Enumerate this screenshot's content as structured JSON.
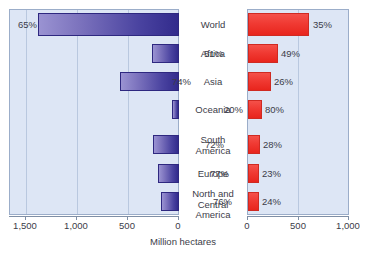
{
  "chart_data": {
    "type": "bar",
    "title": "",
    "subtitle": "",
    "xlabel": "Million hectares",
    "ylabel": "",
    "orientation": "horizontal",
    "layout": "back-to-back bidirectional panels",
    "grid": true,
    "legend": "none",
    "categories": [
      "World",
      "Africa",
      "Asia",
      "Oceania",
      "South America",
      "Europe",
      "North and Central America"
    ],
    "left_axis": {
      "title": "Million hectares",
      "direction": "right-to-left",
      "range": [
        0,
        1500
      ],
      "ticks": [
        1500,
        1000,
        500,
        0
      ],
      "tick_labels": [
        "1,500",
        "1,000",
        "500",
        "0"
      ]
    },
    "right_axis": {
      "title": "Million hectares",
      "direction": "left-to-right",
      "range": [
        0,
        1000
      ],
      "ticks": [
        0,
        500,
        1000
      ],
      "tick_labels": [
        "0",
        "500",
        "1,000"
      ]
    },
    "series": [
      {
        "name": "Left panel (purple)",
        "color": "#4a43a0",
        "values": [
          1380,
          260,
          580,
          60,
          255,
          200,
          170
        ],
        "labels": [
          "65%",
          "51%",
          "74%",
          "20%",
          "72%",
          "77%",
          "76%"
        ]
      },
      {
        "name": "Right panel (red)",
        "color": "#ef3b33",
        "values": [
          600,
          295,
          225,
          135,
          120,
          110,
          110
        ],
        "labels": [
          "35%",
          "49%",
          "26%",
          "80%",
          "28%",
          "23%",
          "24%"
        ]
      }
    ]
  },
  "colors": {
    "panel_background": "#dde6f5",
    "panel_border": "#9badc9",
    "gridline": "#b9c8df",
    "purple_light": "#9a93d2",
    "purple_dark": "#322b8c",
    "red_light": "#f4514a",
    "red_dark": "#e8251d",
    "text": "#3c3c48",
    "axis": "#7f8fa6"
  }
}
